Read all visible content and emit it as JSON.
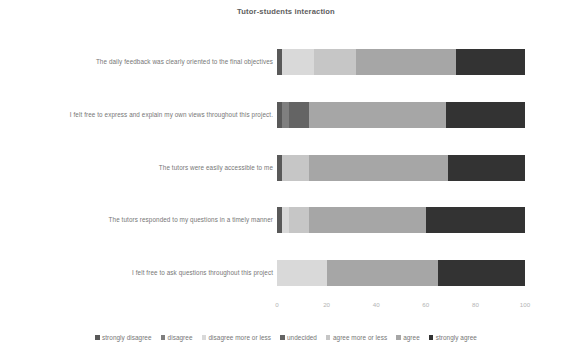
{
  "chart_data": {
    "type": "bar",
    "subtype": "stacked-horizontal-bar",
    "title": "Tutor-students interaction",
    "xlabel": "",
    "ylabel": "",
    "xlim": [
      0,
      100
    ],
    "xticks": [
      0,
      20,
      40,
      60,
      80,
      100
    ],
    "xtick_labels": [
      "0",
      "20",
      "40",
      "60",
      "80",
      "100"
    ],
    "grid": false,
    "legend_position": "bottom",
    "categories": [
      "The daily feedback was clearly oriented to the final objectives",
      "I felt free to express and explain my own views throughout this project.",
      "The tutors were easily accessible to me",
      "The tutors responded to my questions in a timely manner",
      "I felt free to ask questions throughout this project"
    ],
    "series": [
      {
        "name": "strongly disagree",
        "color": "#595959",
        "values": [
          2,
          2,
          2,
          2,
          0
        ]
      },
      {
        "name": "disagree",
        "color": "#7f7f7f",
        "values": [
          0,
          3,
          0,
          0,
          0
        ]
      },
      {
        "name": "disagree more or less",
        "color": "#d9d9d9",
        "values": [
          13,
          0,
          0,
          3,
          20
        ]
      },
      {
        "name": "undecided",
        "color": "#646464",
        "values": [
          0,
          8,
          0,
          0,
          0
        ]
      },
      {
        "name": "agree more or less",
        "color": "#c6c6c6",
        "values": [
          17,
          0,
          11,
          8,
          0
        ]
      },
      {
        "name": "agree",
        "color": "#a6a6a6",
        "values": [
          40,
          55,
          56,
          47,
          45
        ]
      },
      {
        "name": "strongly agree",
        "color": "#333333",
        "values": [
          28,
          32,
          31,
          40,
          35
        ]
      }
    ]
  }
}
